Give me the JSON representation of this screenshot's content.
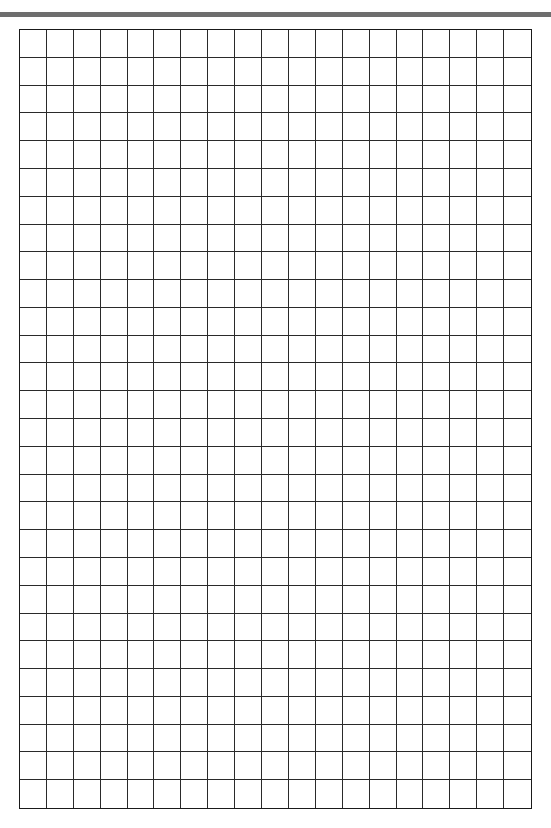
{
  "page": {
    "type": "graph-paper",
    "header_text_clipped": "",
    "header_bar_color": "#6e6e6e"
  },
  "grid": {
    "columns": 19,
    "rows": 28,
    "line_color": "#2a2a2a",
    "border_color": "#1a1a1a",
    "background": "#ffffff"
  }
}
